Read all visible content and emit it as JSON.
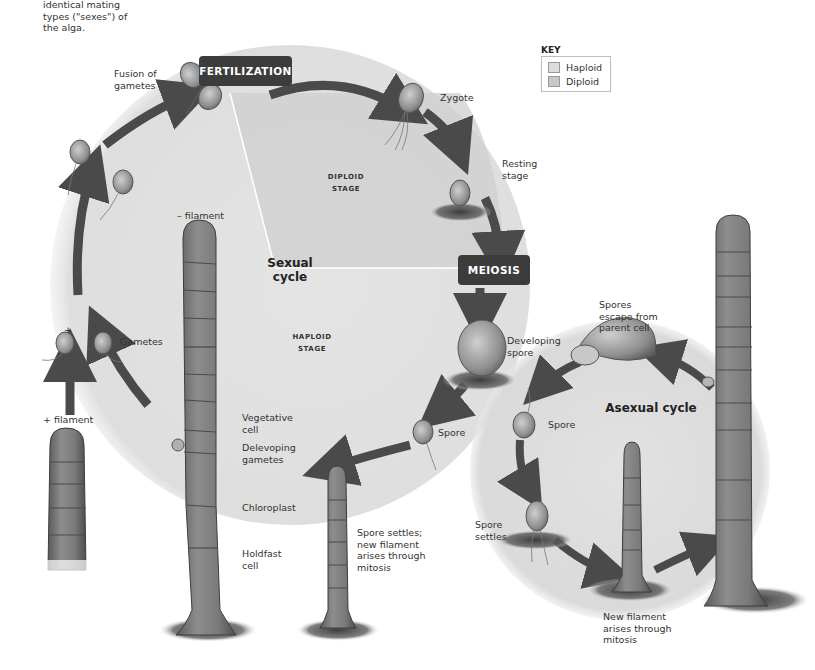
{
  "intro_text": "identical mating\ntypes (\"sexes\") of\nthe alga.",
  "key": {
    "title": "KEY",
    "items": [
      {
        "label": "Haploid",
        "color": "#dcdcdc"
      },
      {
        "label": "Diploid",
        "color": "#c8c8c8"
      }
    ]
  },
  "events": {
    "fertilization": "FERTILIZATION",
    "meiosis": "MEIOSIS"
  },
  "stages": {
    "diploid": "DIPLOID\nSTAGE",
    "haploid": "HAPLOID\nSTAGE"
  },
  "cycles": {
    "sexual": "Sexual\ncycle",
    "asexual": "Asexual cycle"
  },
  "labels": {
    "fusion_of_gametes": "Fusion of\ngametes",
    "zygote": "Zygote",
    "resting_stage": "Resting\nstage",
    "minus_filament": "– filament",
    "plus_filament": "+ filament",
    "plus_sign": "+",
    "minus_sign": "–",
    "gametes": "Gametes",
    "developing_spore": "Developing\nspore",
    "spore_sexual": "Spore",
    "vegetative_cell": "Vegetative\ncell",
    "developing_gametes": "Delevoping\ngametes",
    "chloroplast": "Chloroplast",
    "holdfast_cell": "Holdfast\ncell",
    "spore_settles_new_filament": "Spore settles;\nnew filament\narises through\nmitosis",
    "spores_escape": "Spores\nescape from\nparent cell",
    "spore_asexual": "Spore",
    "spore_settles": "Spore\nsettles",
    "new_filament_mitosis": "New filament\narises through\nmitosis"
  },
  "colors": {
    "diploid_fill": "#c9c9c9",
    "haploid_fill": "#e3e3e3",
    "arrow": "#4a4a4a",
    "event_box": "#3c3c3c",
    "filament": "#6e6e6e"
  }
}
